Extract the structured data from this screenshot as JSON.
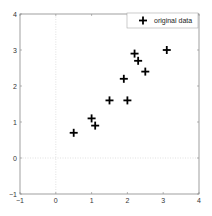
{
  "chart_data": {
    "type": "scatter",
    "title": "",
    "xlabel": "",
    "ylabel": "",
    "xlim": [
      -1,
      4
    ],
    "ylim": [
      -1,
      4
    ],
    "xticks": [
      "-1",
      "0",
      "1",
      "2",
      "3",
      "4"
    ],
    "yticks": [
      "-1",
      "0",
      "1",
      "2",
      "3",
      "4"
    ],
    "grid": false,
    "zero_lines": true,
    "legend_position": "upper right",
    "series": [
      {
        "name": "original data",
        "marker": "+",
        "color": "#000000",
        "x": [
          2.5,
          0.5,
          2.2,
          1.9,
          3.1,
          2.3,
          2.0,
          1.0,
          1.5,
          1.1
        ],
        "y": [
          2.4,
          0.7,
          2.9,
          2.2,
          3.0,
          2.7,
          1.6,
          1.1,
          1.6,
          0.9
        ]
      }
    ]
  },
  "legend": {
    "label": "original data"
  },
  "axis": {
    "x_ticks": [
      "-1",
      "0",
      "1",
      "2",
      "3",
      "4"
    ],
    "y_ticks": [
      "-1",
      "0",
      "1",
      "2",
      "3",
      "4"
    ]
  }
}
